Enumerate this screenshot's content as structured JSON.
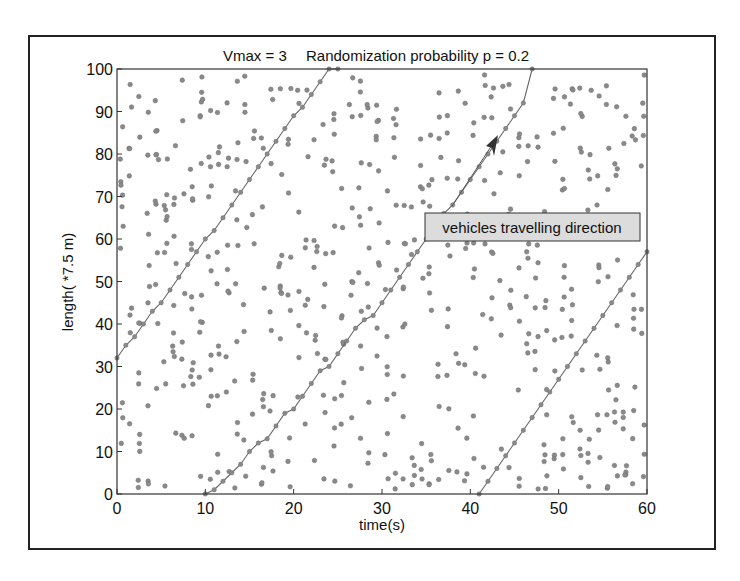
{
  "chart_data": {
    "type": "scatter",
    "title": "Vmax = 3     Randomization probability p = 0.2",
    "title_parts": {
      "vmax": "Vmax = 3",
      "prob": "Randomization probability p = 0.2"
    },
    "xlabel": "time(s)",
    "ylabel": "length( *7.5 m)",
    "xlim": [
      0,
      60
    ],
    "ylim": [
      0,
      100
    ],
    "xticks": [
      0,
      10,
      20,
      30,
      40,
      50,
      60
    ],
    "yticks": [
      0,
      10,
      20,
      30,
      40,
      50,
      60,
      70,
      80,
      90,
      100
    ],
    "grid": false,
    "legend": null,
    "annotation": {
      "text": "vehicles travelling direction",
      "arrow_from": [
        36.5,
        68
      ],
      "arrow_to": [
        43.5,
        85
      ]
    },
    "series": [
      {
        "name": "vehicle positions",
        "kind": "scatter",
        "note": "space-time diagram of cars on a 100-cell ring road, ~1 dot per car per second"
      },
      {
        "name": "trajectory 1",
        "kind": "line",
        "x": [
          0,
          1,
          2,
          3,
          4,
          5,
          6,
          7,
          8,
          9,
          10,
          11,
          12,
          13,
          14,
          15,
          16,
          17,
          18,
          19,
          20,
          21,
          22,
          23,
          24,
          25
        ],
        "y": [
          32,
          35,
          37,
          40,
          43,
          45,
          48,
          51,
          54,
          57,
          60,
          62,
          65,
          68,
          71,
          74,
          77,
          80,
          83,
          86,
          89,
          91,
          94,
          97,
          100,
          100
        ]
      },
      {
        "name": "trajectory 2",
        "kind": "line",
        "x": [
          10,
          11,
          12,
          13,
          14,
          15,
          16,
          17,
          18,
          19,
          20,
          21,
          22,
          23,
          24,
          25,
          26,
          27,
          28,
          29,
          30,
          31,
          32,
          33,
          34,
          35,
          36,
          37,
          38,
          39,
          40,
          41,
          42,
          43,
          44,
          45,
          46,
          47
        ],
        "y": [
          0,
          1,
          3,
          5,
          7,
          10,
          12,
          13,
          16,
          19,
          20,
          23,
          26,
          29,
          30,
          33,
          36,
          39,
          41,
          42,
          45,
          48,
          51,
          54,
          57,
          60,
          63,
          66,
          68,
          71,
          74,
          77,
          80,
          83,
          86,
          89,
          92,
          100
        ]
      },
      {
        "name": "trajectory 3",
        "kind": "line",
        "x": [
          41,
          42,
          43,
          44,
          45,
          46,
          47,
          48,
          49,
          50,
          51,
          52,
          53,
          54,
          55,
          56,
          57,
          58,
          59,
          60
        ],
        "y": [
          0,
          3,
          6,
          9,
          12,
          15,
          18,
          21,
          24,
          27,
          30,
          33,
          36,
          39,
          42,
          45,
          48,
          51,
          54,
          57
        ]
      }
    ]
  },
  "colors": {
    "dot": "#8a8a8a",
    "dot_stroke": "#6e6e6e",
    "line": "#666666",
    "axis": "#333333",
    "annot_bg": "#dcdcdc"
  }
}
